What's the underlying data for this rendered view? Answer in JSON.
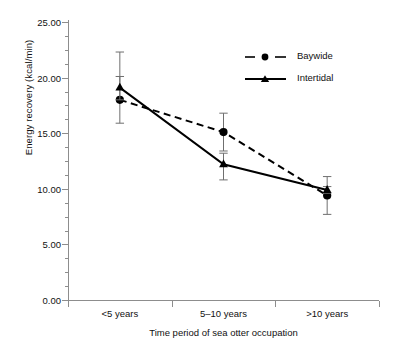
{
  "chart_data": {
    "type": "line",
    "title": "",
    "xlabel": "Time period of sea otter occupation",
    "ylabel": "Energy recovery (kcal/min)",
    "categories": [
      "<5 years",
      "5–10 years",
      ">10 years"
    ],
    "ylim": [
      0,
      25
    ],
    "ytick_values": [
      0,
      5,
      10,
      15,
      20,
      25
    ],
    "ytick_labels": [
      "0.00",
      "5.00",
      "10.00",
      "15.00",
      "20.00",
      "25.00"
    ],
    "ytick_minor_step": 1.25,
    "grid": false,
    "legend_position": "upper right",
    "series": [
      {
        "name": "Baywide",
        "marker": "filled-circle",
        "linestyle": "dashed",
        "color": "#000000",
        "values": [
          18.0,
          15.1,
          9.4
        ],
        "error_upper": [
          20.1,
          16.8,
          11.1
        ],
        "error_lower": [
          15.9,
          13.4,
          7.7
        ]
      },
      {
        "name": "Intertidal",
        "marker": "filled-triangle",
        "linestyle": "solid",
        "color": "#000000",
        "values": [
          19.1,
          12.2,
          9.9
        ],
        "error_upper": [
          22.3,
          13.2,
          10.2
        ],
        "error_lower": [
          18.0,
          10.8,
          9.6
        ]
      }
    ]
  },
  "legend": {
    "entries": [
      {
        "label": "Baywide",
        "symbol": "dashed-line-circle-marker"
      },
      {
        "label": "Intertidal",
        "symbol": "solid-line-triangle-marker"
      }
    ]
  }
}
